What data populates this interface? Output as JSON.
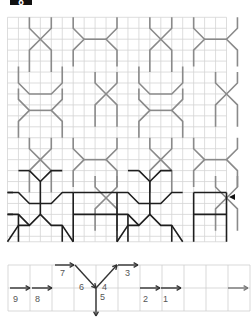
{
  "figure": {
    "badge_label": "8",
    "grid": {
      "cols": 20,
      "rows": 20,
      "origin": [
        7.5,
        17.3
      ],
      "cell": 10.95,
      "line_color": "#cfcfcf"
    },
    "pattern_color_light": "#8a8a8a",
    "pattern_color_dark": "#1e1e1e",
    "row_marker": {
      "symbol": "◀",
      "row_y": 197
    }
  },
  "sequence_strip": {
    "cols": 11,
    "rows": 2,
    "steps": [
      {
        "label": "9",
        "direction": "right"
      },
      {
        "label": "8",
        "direction": "right"
      },
      {
        "label": "7",
        "direction": "right"
      },
      {
        "label": "6",
        "direction": "down-right"
      },
      {
        "label": "5",
        "direction": "down"
      },
      {
        "label": "4",
        "direction": "up-right"
      },
      {
        "label": "3",
        "direction": "right"
      },
      {
        "label": "2",
        "direction": "right"
      },
      {
        "label": "1",
        "direction": "right"
      }
    ],
    "end_arrow": "right"
  }
}
